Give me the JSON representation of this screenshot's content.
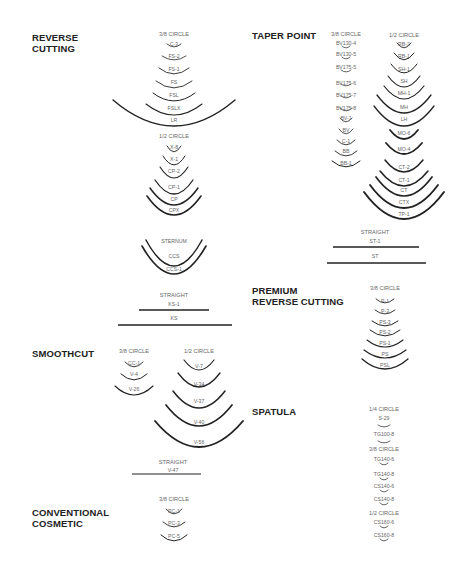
{
  "sections": {
    "reverse_cutting": {
      "title_line1": "REVERSE",
      "title_line2": "CUTTING",
      "groups": [
        {
          "caption": "3/8 CIRCLE",
          "needles": [
            "C-3",
            "FS-2",
            "FS-1",
            "FS",
            "FSL",
            "FSLX",
            "LR"
          ]
        },
        {
          "caption": "1/2 CIRCLE",
          "needles": [
            "X-8",
            "X-1",
            "CP-2",
            "CP-1",
            "CP",
            "CPX"
          ]
        },
        {
          "caption": "",
          "needles": [
            "STERNUM",
            "CCS",
            "CCS-1"
          ]
        },
        {
          "caption": "STRAIGHT",
          "needles": [
            "KS-1",
            "KS"
          ]
        }
      ]
    },
    "smoothcut": {
      "title": "SMOOTHCUT",
      "groups": [
        {
          "caption": "3/8 CIRCLE",
          "needles": [
            "CC-1",
            "V-4",
            "V-26"
          ]
        },
        {
          "caption": "1/2 CIRCLE",
          "needles": [
            "V-7",
            "V-34",
            "V-37",
            "V-40",
            "V-56"
          ]
        },
        {
          "caption": "STRAIGHT",
          "needles": [
            "V-47"
          ]
        }
      ]
    },
    "conventional_cosmetic": {
      "title_line1": "CONVENTIONAL",
      "title_line2": "COSMETIC",
      "groups": [
        {
          "caption": "3/8 CIRCLE",
          "needles": [
            "PC-1",
            "PC-3",
            "PC-5"
          ]
        }
      ]
    },
    "taper_point": {
      "title": "TAPER POINT",
      "groups": [
        {
          "caption": "3/8 CIRCLE",
          "needles": [
            "BV130-4",
            "BV130-5",
            "BV175-5",
            "BV175-6",
            "BV175-7",
            "BV175-8",
            "BV-1",
            "BV",
            "C-1",
            "BB",
            "BB-1"
          ]
        },
        {
          "caption": "1/2 CIRCLE",
          "needles": [
            "RB-2",
            "RB-1",
            "SH-1",
            "SH",
            "MH-1",
            "MH",
            "LH",
            "MO-6",
            "MO-4",
            "CT-2",
            "CT-1",
            "CT",
            "CTX",
            "TP-1"
          ]
        },
        {
          "caption": "STRAIGHT",
          "needles": [
            "ST-1",
            "ST"
          ]
        }
      ]
    },
    "premium_reverse_cutting": {
      "title_line1": "PREMIUM",
      "title_line2": "REVERSE CUTTING",
      "groups": [
        {
          "caption": "3/8 CIRCLE",
          "needles": [
            "P-1",
            "P-3",
            "PS-3",
            "PS-2",
            "PS-1",
            "PS",
            "PSL"
          ]
        }
      ]
    },
    "spatula": {
      "title": "SPATULA",
      "groups": [
        {
          "caption": "1/4 CIRCLE",
          "needles": [
            "S-29",
            "TG100-8"
          ]
        },
        {
          "caption": "3/8 CIRCLE",
          "needles": [
            "TG140-6",
            "TG140-8",
            "CS140-6",
            "CS140-8"
          ]
        },
        {
          "caption": "1/2 CIRCLE",
          "needles": [
            "CS160-6",
            "CS160-8"
          ]
        }
      ]
    }
  },
  "colors": {
    "ink": "#222222",
    "label": "#666666"
  }
}
